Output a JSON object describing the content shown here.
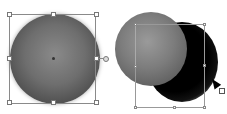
{
  "canvas": {
    "objects": [
      {
        "name": "sphere-selected",
        "state": "selected",
        "tool": "selection"
      },
      {
        "name": "sphere-with-drop-shadow",
        "state": "shadow-being-edited"
      }
    ],
    "cursor": {
      "icon": "pointer-arrow-icon",
      "badge": "scale-badge-icon"
    }
  }
}
